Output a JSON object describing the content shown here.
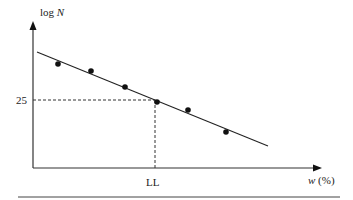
{
  "chart_data": {
    "type": "scatter",
    "title": "",
    "xlabel": "w (%)",
    "ylabel": "log N",
    "x_tick_labels": [
      "LL"
    ],
    "y_tick_labels": [
      "25"
    ],
    "grid": false,
    "legend": null,
    "series": [
      {
        "name": "test points",
        "type": "scatter",
        "points": [
          {
            "x": 58,
            "y": 64
          },
          {
            "x": 91,
            "y": 71
          },
          {
            "x": 125,
            "y": 87
          },
          {
            "x": 157,
            "y": 102
          },
          {
            "x": 188,
            "y": 110
          },
          {
            "x": 226,
            "y": 132
          }
        ]
      },
      {
        "name": "best-fit line",
        "type": "line",
        "points": [
          {
            "x": 37,
            "y": 52
          },
          {
            "x": 268,
            "y": 146
          }
        ]
      }
    ],
    "annotations": [
      {
        "type": "dashed-guide",
        "description": "horizontal from y-axis at 25 to line, vertical down to LL on x-axis"
      }
    ],
    "note": "Coordinates are pixel positions; axes have no numeric scale besides the single marked value 25 (log N at 25 blows) and LL (liquid limit)."
  },
  "labels": {
    "y_axis": "log",
    "y_axis_italic": "N",
    "x_axis": "w",
    "x_axis_unit": "(%)",
    "y_marker": "25",
    "x_marker": "LL"
  }
}
